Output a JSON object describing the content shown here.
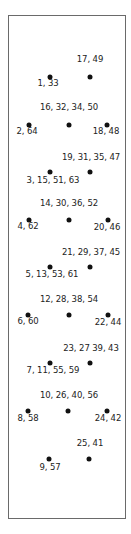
{
  "diagram": {
    "frame_color": "#6a6a6a",
    "dot_color": "#111111",
    "dots": [
      {
        "x": 50,
        "y": 77,
        "label": "1, 33",
        "lx": 48,
        "ly": 83
      },
      {
        "x": 90,
        "y": 77,
        "label": "17, 49",
        "lx": 90,
        "ly": 59
      },
      {
        "x": 29,
        "y": 125,
        "label": "2, 64",
        "lx": 27,
        "ly": 131
      },
      {
        "x": 69,
        "y": 125,
        "label": "16, 32, 34, 50",
        "lx": 69,
        "ly": 107
      },
      {
        "x": 107,
        "y": 125,
        "label": "18, 48",
        "lx": 106,
        "ly": 131
      },
      {
        "x": 50,
        "y": 172,
        "label": "3, 15, 51, 63",
        "lx": 53,
        "ly": 180
      },
      {
        "x": 90,
        "y": 172,
        "label": "19, 31, 35, 47",
        "lx": 91,
        "ly": 157
      },
      {
        "x": 29,
        "y": 220,
        "label": "4, 62",
        "lx": 28,
        "ly": 226
      },
      {
        "x": 69,
        "y": 220,
        "label": "14, 30, 36, 52",
        "lx": 69,
        "ly": 203
      },
      {
        "x": 108,
        "y": 220,
        "label": "20, 46",
        "lx": 107,
        "ly": 227
      },
      {
        "x": 50,
        "y": 267,
        "label": "5, 13, 53, 61",
        "lx": 52,
        "ly": 274
      },
      {
        "x": 90,
        "y": 267,
        "label": "21, 29, 37, 45",
        "lx": 91,
        "ly": 252
      },
      {
        "x": 28,
        "y": 315,
        "label": "6, 60",
        "lx": 28,
        "ly": 321
      },
      {
        "x": 69,
        "y": 315,
        "label": "12, 28, 38, 54",
        "lx": 69,
        "ly": 299
      },
      {
        "x": 108,
        "y": 315,
        "label": "22, 44",
        "lx": 108,
        "ly": 322
      },
      {
        "x": 50,
        "y": 363,
        "label": "7, 11, 55, 59",
        "lx": 53,
        "ly": 370
      },
      {
        "x": 90,
        "y": 363,
        "label": "23, 27 39, 43",
        "lx": 91,
        "ly": 348
      },
      {
        "x": 28,
        "y": 411,
        "label": "8, 58",
        "lx": 28,
        "ly": 418
      },
      {
        "x": 68,
        "y": 411,
        "label": "10, 26, 40, 56",
        "lx": 69,
        "ly": 395
      },
      {
        "x": 107,
        "y": 411,
        "label": "24, 42",
        "lx": 108,
        "ly": 418
      },
      {
        "x": 49,
        "y": 459,
        "label": "9, 57",
        "lx": 50,
        "ly": 467
      },
      {
        "x": 89,
        "y": 459,
        "label": "25, 41",
        "lx": 90,
        "ly": 443
      }
    ]
  }
}
